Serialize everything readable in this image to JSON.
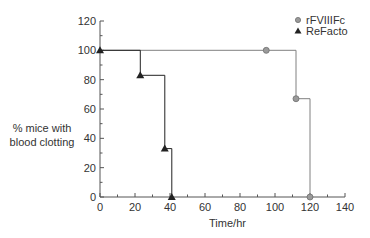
{
  "chart_data": {
    "type": "line",
    "subtype": "step (Kaplan-Meier style)",
    "title": "",
    "xlabel": "Time/hr",
    "ylabel": "% mice with blood clotting",
    "ylabel_lines": [
      "% mice with",
      "blood clotting"
    ],
    "xlim": [
      0,
      140
    ],
    "ylim": [
      0,
      120
    ],
    "xticks": [
      0,
      20,
      40,
      60,
      80,
      100,
      120,
      140
    ],
    "yticks": [
      0,
      20,
      40,
      60,
      80,
      100,
      120
    ],
    "grid": false,
    "legend_position": "top-right",
    "series": [
      {
        "name": "rFVIIIFc",
        "marker": "circle",
        "color": "#808080",
        "steps": [
          [
            0,
            100
          ],
          [
            112,
            100
          ],
          [
            112,
            67
          ],
          [
            120,
            67
          ],
          [
            120,
            0
          ]
        ],
        "markers": [
          [
            95,
            100
          ],
          [
            112,
            67
          ],
          [
            120,
            0
          ]
        ]
      },
      {
        "name": "ReFacto",
        "marker": "triangle",
        "color": "#222222",
        "steps": [
          [
            0,
            100
          ],
          [
            23,
            100
          ],
          [
            23,
            83
          ],
          [
            37,
            83
          ],
          [
            37,
            33
          ],
          [
            41,
            33
          ],
          [
            41,
            0
          ]
        ],
        "markers": [
          [
            0,
            100
          ],
          [
            23,
            83
          ],
          [
            37,
            33
          ],
          [
            41,
            0
          ]
        ]
      }
    ]
  },
  "legend": {
    "items": [
      {
        "label": "rFVIIIFc",
        "icon": "circle-marker-icon"
      },
      {
        "label": "ReFacto",
        "icon": "triangle-marker-icon"
      }
    ]
  }
}
